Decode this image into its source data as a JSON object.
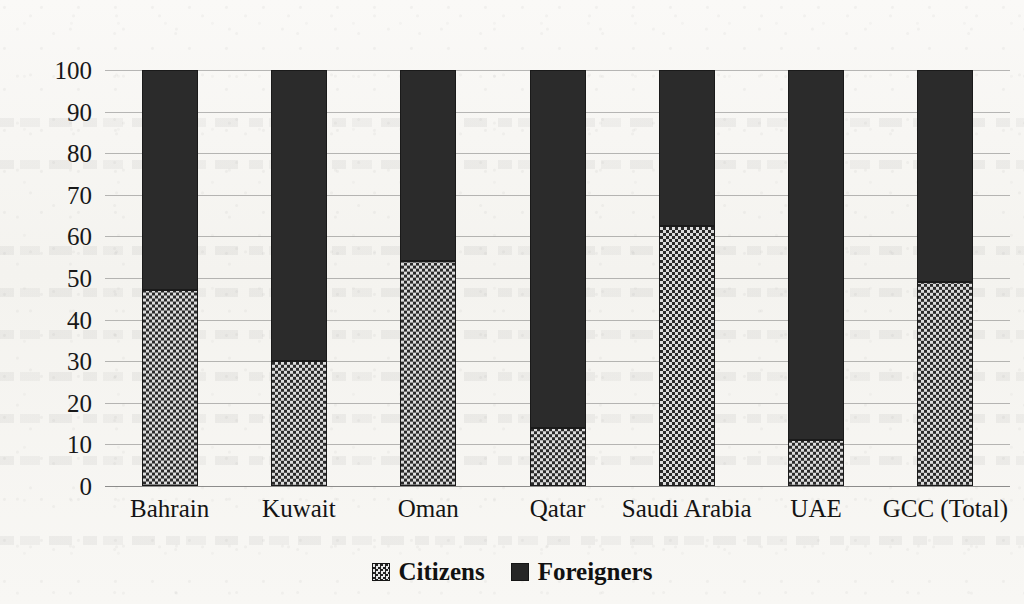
{
  "chart_data": {
    "type": "bar",
    "subtype": "stacked-100-percent",
    "title": "",
    "xlabel": "",
    "ylabel": "",
    "ylim": [
      0,
      100
    ],
    "yticks": [
      0,
      10,
      20,
      30,
      40,
      50,
      60,
      70,
      80,
      90,
      100
    ],
    "grid": true,
    "legend_position": "bottom",
    "categories": [
      "Bahrain",
      "Kuwait",
      "Oman",
      "Qatar",
      "Saudi Arabia",
      "UAE",
      "GCC (Total)"
    ],
    "series": [
      {
        "name": "Citizens",
        "pattern": "checkered",
        "color": "#cfcfcf",
        "values": [
          47,
          30,
          54,
          14,
          62.5,
          11,
          49
        ]
      },
      {
        "name": "Foreigners",
        "pattern": "solid",
        "color": "#2b2b2b",
        "values": [
          53,
          70,
          46,
          86,
          37.5,
          89,
          51
        ]
      }
    ]
  },
  "axis": {
    "y_tick_labels": [
      "100",
      "90",
      "80",
      "70",
      "60",
      "50",
      "40",
      "30",
      "20",
      "10",
      "0"
    ],
    "x_tick_labels": [
      "Bahrain",
      "Kuwait",
      "Oman",
      "Qatar",
      "Saudi Arabia",
      "UAE",
      "GCC (Total)"
    ]
  },
  "legend": {
    "items": [
      {
        "label": "Citizens",
        "marker": "checkered-square-icon"
      },
      {
        "label": "Foreigners",
        "marker": "filled-square-icon"
      }
    ]
  }
}
